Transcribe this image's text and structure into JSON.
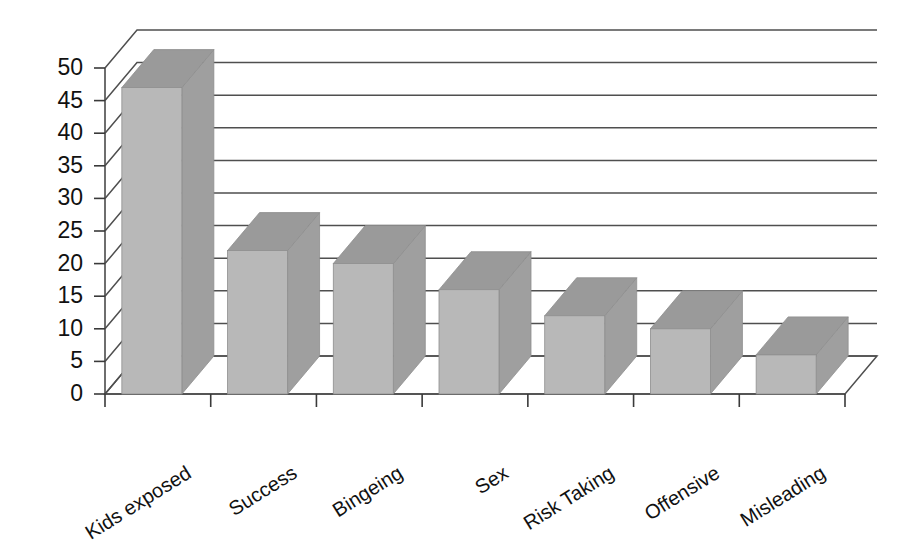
{
  "chart_data": {
    "type": "bar",
    "title": "",
    "subtitle": "",
    "xlabel": "",
    "ylabel": "",
    "categories": [
      "Kids exposed",
      "Success",
      "Bingeing",
      "Sex",
      "Risk Taking",
      "Offensive",
      "Misleading"
    ],
    "values": [
      47,
      22,
      20,
      16,
      12,
      10,
      6
    ],
    "series": [
      {
        "name": "",
        "values": [
          47,
          22,
          20,
          16,
          12,
          10,
          6
        ]
      }
    ],
    "ylim": [
      0,
      50
    ],
    "ytick_labels": [
      "0",
      "5",
      "10",
      "15",
      "20",
      "25",
      "30",
      "35",
      "40",
      "45",
      "50"
    ],
    "ytick_values": [
      0,
      5,
      10,
      15,
      20,
      25,
      30,
      35,
      40,
      45,
      50
    ],
    "grid": true,
    "grid_axis": "y",
    "legend": false,
    "legend_position": "none",
    "style": "3d-column",
    "annotations": []
  },
  "colors": {
    "bar_front": "#b8b8b8",
    "bar_top": "#9a9a9a",
    "bar_side": "#9f9f9f",
    "gridline": "#4f4f4f",
    "axis": "#3a3a3a",
    "text": "#111111",
    "background": "#ffffff"
  }
}
